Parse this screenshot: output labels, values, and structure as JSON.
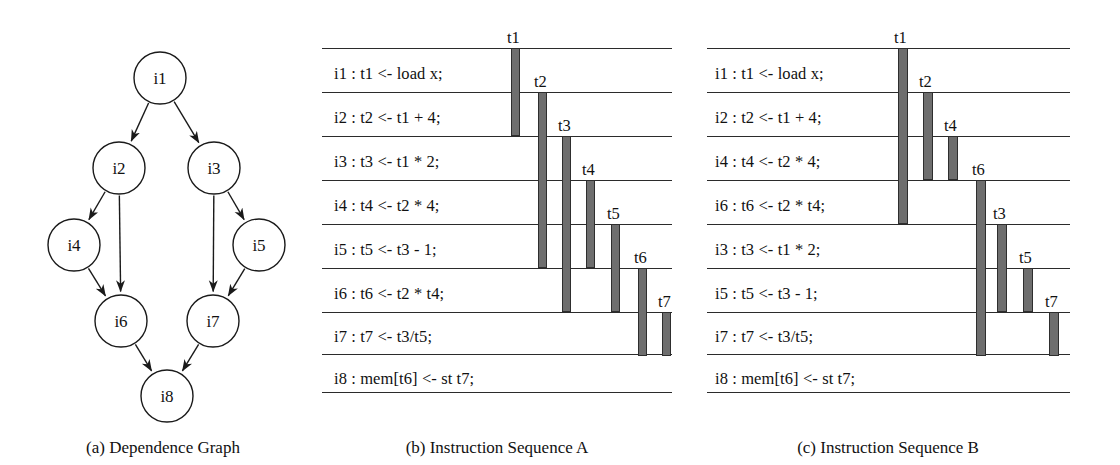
{
  "figure": {
    "panels": [
      {
        "id": "a",
        "caption": "(a) Dependence Graph"
      },
      {
        "id": "b",
        "caption": "(b) Instruction Sequence A"
      },
      {
        "id": "c",
        "caption": "(c) Instruction Sequence B"
      }
    ]
  },
  "dependence_graph": {
    "caption": "(a) Dependence Graph",
    "nodes": [
      {
        "id": "i1",
        "label": "i1",
        "cx": 160,
        "cy": 78,
        "r": 26
      },
      {
        "id": "i2",
        "label": "i2",
        "cx": 119,
        "cy": 168,
        "r": 26
      },
      {
        "id": "i3",
        "label": "i3",
        "cx": 214,
        "cy": 168,
        "r": 26
      },
      {
        "id": "i4",
        "label": "i4",
        "cx": 74,
        "cy": 245,
        "r": 26
      },
      {
        "id": "i5",
        "label": "i5",
        "cx": 259,
        "cy": 245,
        "r": 26
      },
      {
        "id": "i6",
        "label": "i6",
        "cx": 121,
        "cy": 321,
        "r": 26
      },
      {
        "id": "i7",
        "label": "i7",
        "cx": 213,
        "cy": 321,
        "r": 26
      },
      {
        "id": "i8",
        "label": "i8",
        "cx": 167,
        "cy": 396,
        "r": 26
      }
    ],
    "edges": [
      {
        "from": "i1",
        "to": "i2"
      },
      {
        "from": "i1",
        "to": "i3"
      },
      {
        "from": "i2",
        "to": "i4"
      },
      {
        "from": "i2",
        "to": "i6"
      },
      {
        "from": "i3",
        "to": "i5"
      },
      {
        "from": "i3",
        "to": "i7"
      },
      {
        "from": "i4",
        "to": "i6"
      },
      {
        "from": "i5",
        "to": "i7"
      },
      {
        "from": "i6",
        "to": "i8"
      },
      {
        "from": "i7",
        "to": "i8"
      }
    ]
  },
  "sequence_a": {
    "caption": "(b) Instruction Sequence A",
    "rule_x0": 322,
    "rule_x1": 672,
    "rule_ys": [
      48,
      92,
      136,
      180,
      224,
      268,
      312,
      354,
      392
    ],
    "instructions": [
      {
        "id": "i1",
        "text": "i1 : t1 <- load x;",
        "x": 334,
        "y": 64
      },
      {
        "id": "i2",
        "text": "i2 : t2 <- t1 + 4;",
        "x": 334,
        "y": 108
      },
      {
        "id": "i3",
        "text": "i3 : t3 <- t1 * 2;",
        "x": 334,
        "y": 152
      },
      {
        "id": "i4",
        "text": "i4 : t4 <- t2 * 4;",
        "x": 334,
        "y": 196
      },
      {
        "id": "i5",
        "text": "i5 : t5 <- t3 - 1;",
        "x": 334,
        "y": 240
      },
      {
        "id": "i6",
        "text": "i6 : t6 <- t2 * t4;",
        "x": 334,
        "y": 284
      },
      {
        "id": "i7",
        "text": "i7 : t7 <- t3/t5;",
        "x": 334,
        "y": 327
      },
      {
        "id": "i8",
        "text": "i8 : mem[t6] <- st t7;",
        "x": 334,
        "y": 369
      }
    ],
    "lifetimes": [
      {
        "name": "t1",
        "x": 511,
        "w": 9,
        "y0": 48,
        "y1": 136,
        "label_x": 507,
        "label_y": 28
      },
      {
        "name": "t2",
        "x": 538,
        "w": 9,
        "y0": 92,
        "y1": 268,
        "label_x": 534,
        "label_y": 72
      },
      {
        "name": "t3",
        "x": 562,
        "w": 9,
        "y0": 136,
        "y1": 312,
        "label_x": 558,
        "label_y": 116
      },
      {
        "name": "t4",
        "x": 586,
        "w": 9,
        "y0": 180,
        "y1": 268,
        "label_x": 582,
        "label_y": 160
      },
      {
        "name": "t5",
        "x": 611,
        "w": 9,
        "y0": 224,
        "y1": 312,
        "label_x": 607,
        "label_y": 204
      },
      {
        "name": "t6",
        "x": 638,
        "w": 9,
        "y0": 268,
        "y1": 356,
        "label_x": 634,
        "label_y": 248
      },
      {
        "name": "t7",
        "x": 662,
        "w": 9,
        "y0": 312,
        "y1": 356,
        "label_x": 658,
        "label_y": 292
      }
    ]
  },
  "sequence_b": {
    "caption": "(c) Instruction Sequence B",
    "rule_x0": 707,
    "rule_x1": 1070,
    "rule_ys": [
      48,
      92,
      136,
      180,
      224,
      268,
      312,
      354,
      392
    ],
    "instructions": [
      {
        "id": "i1",
        "text": "i1 : t1 <- load x;",
        "x": 715,
        "y": 64
      },
      {
        "id": "i2",
        "text": "i2 : t2 <- t1 + 4;",
        "x": 715,
        "y": 108
      },
      {
        "id": "i4",
        "text": "i4 : t4 <- t2 * 4;",
        "x": 715,
        "y": 152
      },
      {
        "id": "i6",
        "text": "i6 : t6 <- t2 * t4;",
        "x": 715,
        "y": 196
      },
      {
        "id": "i3",
        "text": "i3 : t3 <- t1 * 2;",
        "x": 715,
        "y": 240
      },
      {
        "id": "i5",
        "text": "i5 : t5 <- t3 - 1;",
        "x": 715,
        "y": 284
      },
      {
        "id": "i7",
        "text": "i7 : t7 <- t3/t5;",
        "x": 715,
        "y": 327
      },
      {
        "id": "i8",
        "text": "i8 : mem[t6] <- st t7;",
        "x": 715,
        "y": 369
      }
    ],
    "lifetimes": [
      {
        "name": "t1",
        "x": 898,
        "w": 10,
        "y0": 48,
        "y1": 224,
        "label_x": 894,
        "label_y": 28
      },
      {
        "name": "t2",
        "x": 923,
        "w": 10,
        "y0": 92,
        "y1": 180,
        "label_x": 919,
        "label_y": 72
      },
      {
        "name": "t4",
        "x": 948,
        "w": 10,
        "y0": 136,
        "y1": 180,
        "label_x": 944,
        "label_y": 116
      },
      {
        "name": "t6",
        "x": 976,
        "w": 10,
        "y0": 180,
        "y1": 356,
        "label_x": 972,
        "label_y": 160
      },
      {
        "name": "t3",
        "x": 997,
        "w": 10,
        "y0": 224,
        "y1": 312,
        "label_x": 993,
        "label_y": 204
      },
      {
        "name": "t5",
        "x": 1023,
        "w": 10,
        "y0": 268,
        "y1": 312,
        "label_x": 1019,
        "label_y": 248
      },
      {
        "name": "t7",
        "x": 1049,
        "w": 10,
        "y0": 312,
        "y1": 356,
        "label_x": 1045,
        "label_y": 292
      }
    ]
  },
  "captions": {
    "a": {
      "text": "(a) Dependence Graph",
      "cx": 163,
      "y": 438
    },
    "b": {
      "text": "(b) Instruction Sequence A",
      "cx": 497,
      "y": 438
    },
    "c": {
      "text": "(c) Instruction Sequence B",
      "cx": 888,
      "y": 438
    }
  },
  "colors": {
    "bar_fill": "#6e6e6e",
    "bar_stroke": "#2e2e2e",
    "rule": "#2b2b2b",
    "text": "#111111",
    "node_stroke": "#1a1a1a",
    "background": "#ffffff"
  }
}
